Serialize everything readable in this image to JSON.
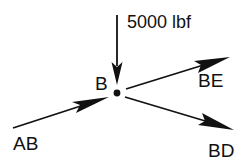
{
  "diagram": {
    "type": "free-body-diagram",
    "node": {
      "label": "B",
      "x": 117,
      "y": 93
    },
    "applied_load": {
      "label": "5000 lbf",
      "direction": "down"
    },
    "members": [
      {
        "id": "AB",
        "label": "AB",
        "direction": "into-node"
      },
      {
        "id": "BE",
        "label": "BE",
        "direction": "away-from-node"
      },
      {
        "id": "BD",
        "label": "BD",
        "direction": "away-from-node"
      }
    ],
    "colors": {
      "stroke": "#111111",
      "background": "#ffffff"
    }
  }
}
